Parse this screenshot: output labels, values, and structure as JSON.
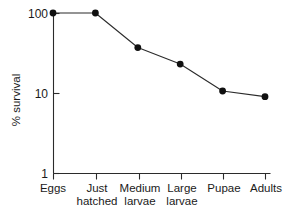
{
  "chart_data": {
    "type": "line",
    "title": "",
    "xlabel": "",
    "ylabel": "% survival",
    "yscale": "log",
    "ylim": [
      1,
      100
    ],
    "yticks": [
      1,
      10,
      100
    ],
    "ytick_labels": [
      "1",
      "10",
      "100"
    ],
    "grid": false,
    "legend": "none",
    "marker": "filled-circle",
    "categories": [
      "Eggs",
      "Just hatched",
      "Medium larvae",
      "Large larvae",
      "Pupae",
      "Adults"
    ],
    "category_lines": [
      [
        "Eggs"
      ],
      [
        "Just",
        "hatched"
      ],
      [
        "Medium",
        "larvae"
      ],
      [
        "Large",
        "larvae"
      ],
      [
        "Pupae"
      ],
      [
        "Adults"
      ]
    ],
    "values": [
      100,
      100,
      37,
      23,
      10.6,
      9
    ],
    "series": [
      {
        "name": "% survival",
        "values": [
          100,
          100,
          37,
          23,
          10.6,
          9
        ]
      }
    ],
    "colors": {
      "line": "#2b2b2b",
      "marker": "#101010",
      "axis": "#2b2b2b",
      "background": "#ffffff",
      "text": "#1a1a1a"
    }
  }
}
